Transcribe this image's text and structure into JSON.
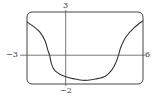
{
  "chart_data": {
    "type": "line",
    "title": "",
    "xlabel": "",
    "ylabel": "",
    "xlim": [
      -3,
      6
    ],
    "ylim": [
      -2,
      3
    ],
    "grid": false,
    "legend": null,
    "tick_labels": {
      "xmin": "−3",
      "xmax": "6",
      "ymax": "3",
      "ymin": "−2"
    },
    "series": [
      {
        "name": "f(x)",
        "x": [
          -3,
          -2.5,
          -2,
          -1.6,
          -1.4,
          -1.25,
          -1.1,
          -0.8,
          0,
          1,
          1.5,
          2,
          3,
          3.6,
          3.9,
          4.1,
          4.3,
          4.7,
          5.3,
          6
        ],
        "y": [
          2.3,
          2.0,
          1.6,
          1.0,
          0.4,
          0,
          -0.6,
          -1.1,
          -1.5,
          -1.7,
          -1.75,
          -1.7,
          -1.5,
          -1.0,
          -0.5,
          0,
          0.6,
          1.3,
          1.9,
          2.4
        ]
      }
    ],
    "colors": {
      "curve": "#333333",
      "frame": "#444444",
      "axes": "#555555"
    }
  }
}
